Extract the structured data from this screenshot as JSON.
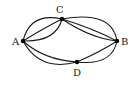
{
  "diagram": {
    "type": "multigraph",
    "colors": {
      "stroke": "#1a1a1a",
      "node": "#000000",
      "background": "#ffffff"
    },
    "nodes": [
      {
        "id": "A",
        "label": "A",
        "x": 23,
        "y": 41,
        "label_x": 12,
        "label_y": 45
      },
      {
        "id": "C",
        "label": "C",
        "x": 62,
        "y": 19,
        "label_x": 56,
        "label_y": 13
      },
      {
        "id": "B",
        "label": "B",
        "x": 117,
        "y": 41,
        "label_x": 121,
        "label_y": 45
      },
      {
        "id": "D",
        "label": "D",
        "x": 77,
        "y": 62,
        "label_x": 73,
        "label_y": 76
      }
    ],
    "edges": [
      {
        "from": "A",
        "to": "C",
        "path": "M23,41 Q30,12 62,19"
      },
      {
        "from": "A",
        "to": "C",
        "path": "M23,41 Q44,28 62,19"
      },
      {
        "from": "A",
        "to": "C",
        "path": "M23,41 Q56,42 62,19"
      },
      {
        "from": "C",
        "to": "B",
        "path": "M62,19 Q112,10 117,41"
      },
      {
        "from": "C",
        "to": "B",
        "path": "M62,19 Q92,28 117,41"
      },
      {
        "from": "C",
        "to": "B",
        "path": "M62,19 Q90,38 117,41"
      },
      {
        "from": "A",
        "to": "D",
        "path": "M23,41 Q44,60 77,62"
      },
      {
        "from": "A",
        "to": "D",
        "path": "M23,41 Q40,72 77,62"
      },
      {
        "from": "D",
        "to": "B",
        "path": "M77,62 Q100,52 117,41"
      },
      {
        "from": "D",
        "to": "B",
        "path": "M77,62 Q112,66 117,41"
      }
    ]
  }
}
